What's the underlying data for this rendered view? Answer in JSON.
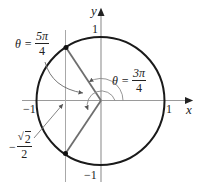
{
  "diagram": {
    "type": "unit-circle",
    "axes": {
      "x_label": "x",
      "y_label": "y",
      "ticks": {
        "x_pos": "1",
        "x_neg": "−1",
        "y_pos": "1",
        "y_neg": "−1"
      }
    },
    "angles": [
      {
        "name": "theta-5pi-4",
        "lhs": "θ =",
        "numerator": "5π",
        "denominator": "4"
      },
      {
        "name": "theta-3pi-4",
        "lhs": "θ =",
        "numerator": "3π",
        "denominator": "4"
      }
    ],
    "x_coordinate_label": {
      "sign": "−",
      "radical": "√",
      "radicand": "2",
      "denominator": "2"
    },
    "colors": {
      "circle": "#1a1a1a",
      "axes": "#9a9a9a",
      "terminal_lines": "#6e6e6e",
      "arcs": "#8a8a8a",
      "points": "#111111"
    }
  }
}
